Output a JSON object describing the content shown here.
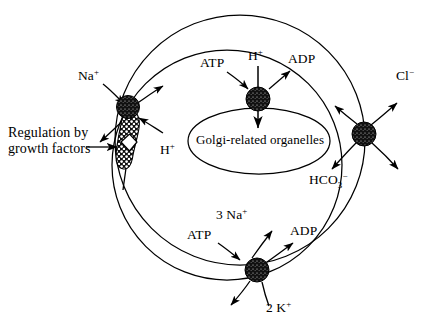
{
  "figure": {
    "type": "cell-membrane-transport-diagram",
    "title": "",
    "background_color": "#ffffff",
    "line_color": "#000000",
    "transporter_fill": "#111111"
  },
  "membrane": {
    "name": "plasma-membrane",
    "shape": "two-overlapping-circles"
  },
  "organelle": {
    "label": "Golgi-related organelles",
    "shape": "ellipse"
  },
  "transporters": [
    {
      "id": "na-h-exchanger",
      "name": "Na+/H+ exchanger with growth-factor receptor",
      "position": "left",
      "has_receptor_site": true
    },
    {
      "id": "h-atpase",
      "name": "H+ ATPase (proton pump)",
      "position": "center"
    },
    {
      "id": "cl-hco3-exchanger",
      "name": "Cl-/HCO3- anion exchanger",
      "position": "right"
    },
    {
      "id": "na-k-atpase",
      "name": "Na+/K+ ATPase",
      "position": "bottom"
    }
  ],
  "labels": {
    "na_left": "Na",
    "na_left_charge": "+",
    "h_left": "H",
    "h_left_charge": "+",
    "regulation_line1": "Regulation by",
    "regulation_line2": "growth factors",
    "atp_center": "ATP",
    "h_center": "H",
    "h_center_charge": "+",
    "adp_center": "ADP",
    "golgi": "Golgi-related organelles",
    "cl_right": "Cl",
    "cl_right_charge": "−",
    "hco3_right": "HCO",
    "hco3_sub": "3",
    "hco3_charge": "−",
    "na_bottom": "3 Na",
    "na_bottom_charge": "+",
    "atp_bottom": "ATP",
    "adp_bottom": "ADP",
    "k_bottom": "2 K",
    "k_bottom_charge": "+"
  }
}
